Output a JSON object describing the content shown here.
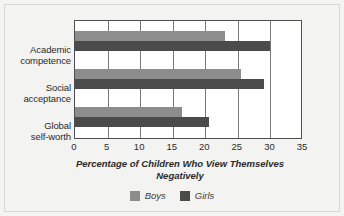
{
  "chart_data": {
    "type": "bar",
    "orientation": "horizontal",
    "title": "",
    "xlabel": "Percentage of Children Who View Themselves Negatively",
    "ylabel": "",
    "xlim": [
      0,
      35
    ],
    "xticks": [
      0,
      5,
      10,
      15,
      20,
      25,
      30,
      35
    ],
    "grid": true,
    "legend_position": "bottom",
    "categories": [
      "Academic competence",
      "Social acceptance",
      "Global self-worth"
    ],
    "category_lines": [
      [
        "Academic",
        "competence"
      ],
      [
        "Social",
        "acceptance"
      ],
      [
        "Global",
        "self-worth"
      ]
    ],
    "series": [
      {
        "name": "Boys",
        "color": "#8d8d8d",
        "values": [
          23,
          25.5,
          16.5
        ]
      },
      {
        "name": "Girls",
        "color": "#4b4b4b",
        "values": [
          30,
          29,
          20.5
        ]
      }
    ]
  },
  "legend": {
    "items": [
      {
        "label": "Boys",
        "color": "#8d8d8d"
      },
      {
        "label": "Girls",
        "color": "#4b4b4b"
      }
    ]
  },
  "axis_title": {
    "line1": "Percentage of Children Who View Themselves",
    "line2": "Negatively"
  },
  "colors": {
    "background": "#f3f3f2",
    "plot_background": "#ffffff",
    "axis": "#4d4d4d",
    "gridline": "#7a7a7a",
    "text": "#2b2b2b"
  }
}
